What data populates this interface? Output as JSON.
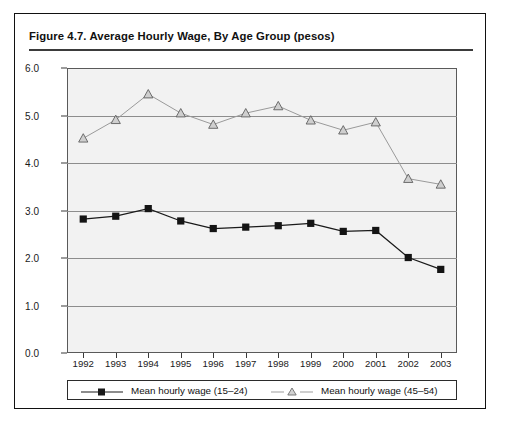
{
  "figure": {
    "title": "Figure 4.7.  Average Hourly Wage, By Age Group (pesos)"
  },
  "chart_data": {
    "type": "line",
    "title": "Figure 4.7.  Average Hourly Wage, By Age Group (pesos)",
    "xlabel": "",
    "ylabel": "",
    "ylim": [
      0.0,
      6.0
    ],
    "ytick_labels": [
      "0.0",
      "1.0",
      "2.0",
      "3.0",
      "4.0",
      "5.0",
      "6.0"
    ],
    "ytick_values": [
      0.0,
      1.0,
      2.0,
      3.0,
      4.0,
      5.0,
      6.0
    ],
    "grid": true,
    "legend_position": "bottom",
    "categories": [
      "1992",
      "1993",
      "1994",
      "1995",
      "1996",
      "1997",
      "1998",
      "1999",
      "2000",
      "2001",
      "2002",
      "2003"
    ],
    "x": [
      1992,
      1993,
      1994,
      1995,
      1996,
      1997,
      1998,
      1999,
      2000,
      2001,
      2002,
      2003
    ],
    "series": [
      {
        "name": "Mean hourly wage (15–24)",
        "marker": "filled-square",
        "color": "#1a1a1a",
        "values": [
          2.82,
          2.88,
          3.04,
          2.78,
          2.62,
          2.65,
          2.68,
          2.73,
          2.56,
          2.58,
          2.01,
          1.76
        ]
      },
      {
        "name": "Mean hourly wage (45–54)",
        "marker": "open-triangle",
        "color": "#9a9a9a",
        "values": [
          4.52,
          4.91,
          5.45,
          5.05,
          4.81,
          5.05,
          5.2,
          4.9,
          4.69,
          4.86,
          3.67,
          3.55
        ]
      }
    ]
  },
  "legend": {
    "entries": [
      {
        "label": "Mean hourly wage (15–24)"
      },
      {
        "label": "Mean hourly wage (45–54)"
      }
    ]
  }
}
